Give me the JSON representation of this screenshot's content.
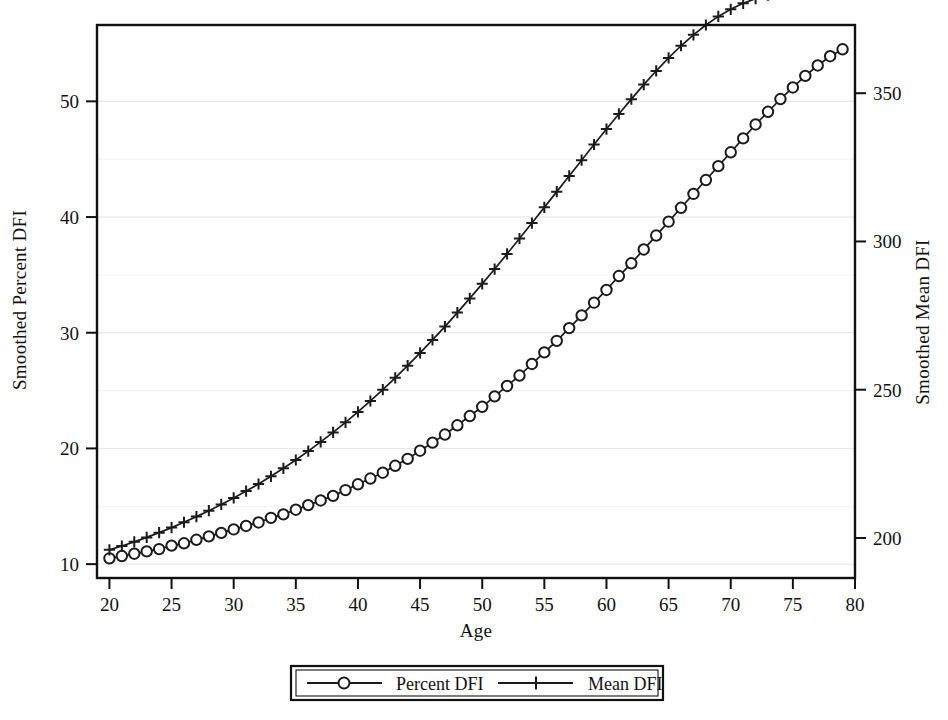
{
  "figure": {
    "background_color": "#ffffff",
    "ink_color": "#1b1b1b",
    "grid_color": "#e4e4e8"
  },
  "axes": {
    "x_title": "Age",
    "y_left_title": "Smoothed Percent DFI",
    "y_right_title": "Smoothed Mean DFI"
  },
  "legend": {
    "entries": [
      {
        "label": "Percent DFI",
        "marker": "circle-marker"
      },
      {
        "label": "Mean DFI",
        "marker": "plus-marker"
      }
    ]
  },
  "chart_data": {
    "type": "line",
    "title": "",
    "xlabel": "Age",
    "ylabel": "Smoothed Percent DFI",
    "ylabel_right": "Smoothed Mean DFI",
    "grid": true,
    "legend_position": "bottom-center",
    "xlim": [
      19,
      80
    ],
    "xticks": [
      20,
      25,
      30,
      35,
      40,
      45,
      50,
      55,
      60,
      65,
      70,
      75,
      80
    ],
    "xtick_labels": [
      "20",
      "25",
      "30",
      "35",
      "40",
      "45",
      "50",
      "55",
      "60",
      "65",
      "70",
      "75",
      "80"
    ],
    "ylim_left": [
      8.8,
      56.6
    ],
    "yticks_left": [
      10,
      20,
      30,
      40,
      50
    ],
    "ytick_labels_left": [
      "10",
      "20",
      "30",
      "40",
      "50"
    ],
    "yminor_left": [
      15,
      25,
      35,
      45
    ],
    "ylim_right": [
      186.5,
      373.0
    ],
    "yticks_right": [
      200,
      250,
      300,
      350
    ],
    "ytick_labels_right": [
      "200",
      "250",
      "300",
      "350"
    ],
    "x": [
      20,
      21,
      22,
      23,
      24,
      25,
      26,
      27,
      28,
      29,
      30,
      31,
      32,
      33,
      34,
      35,
      36,
      37,
      38,
      39,
      40,
      41,
      42,
      43,
      44,
      45,
      46,
      47,
      48,
      49,
      50,
      51,
      52,
      53,
      54,
      55,
      56,
      57,
      58,
      59,
      60,
      61,
      62,
      63,
      64,
      65,
      66,
      67,
      68,
      69,
      70,
      71,
      72,
      73,
      74,
      75,
      76,
      77,
      78,
      79
    ],
    "series": [
      {
        "name": "Percent DFI",
        "marker": "circle",
        "axis": "left",
        "values": [
          10.5,
          10.7,
          10.9,
          11.1,
          11.3,
          11.6,
          11.8,
          12.1,
          12.4,
          12.7,
          13.0,
          13.3,
          13.6,
          14.0,
          14.3,
          14.7,
          15.1,
          15.5,
          15.9,
          16.4,
          16.9,
          17.4,
          17.9,
          18.5,
          19.1,
          19.8,
          20.5,
          21.2,
          22.0,
          22.8,
          23.6,
          24.5,
          25.4,
          26.3,
          27.3,
          28.3,
          29.3,
          30.4,
          31.5,
          32.6,
          33.7,
          34.9,
          36.0,
          37.2,
          38.4,
          39.6,
          40.8,
          42.0,
          43.2,
          44.4,
          45.6,
          46.8,
          48.0,
          49.1,
          50.2,
          51.2,
          52.2,
          53.1,
          53.9,
          54.5
        ]
      },
      {
        "name": "Mean DFI",
        "marker": "plus",
        "axis": "right",
        "values": [
          196.0,
          197.3,
          198.7,
          200.2,
          201.8,
          203.5,
          205.3,
          207.2,
          209.2,
          211.3,
          213.5,
          215.8,
          218.2,
          220.8,
          223.5,
          226.3,
          229.3,
          232.4,
          235.6,
          239.0,
          242.5,
          246.2,
          250.0,
          254.0,
          258.1,
          262.4,
          266.8,
          271.3,
          276.0,
          280.8,
          285.7,
          290.7,
          295.8,
          301.0,
          306.2,
          311.5,
          316.8,
          322.1,
          327.4,
          332.7,
          337.9,
          343.0,
          348.0,
          352.9,
          357.5,
          361.9,
          366.0,
          369.7,
          373.0,
          375.9,
          378.3,
          380.3,
          381.9,
          383.1,
          384.0,
          384.6,
          385.0,
          385.3,
          385.5,
          385.7
        ]
      }
    ]
  }
}
